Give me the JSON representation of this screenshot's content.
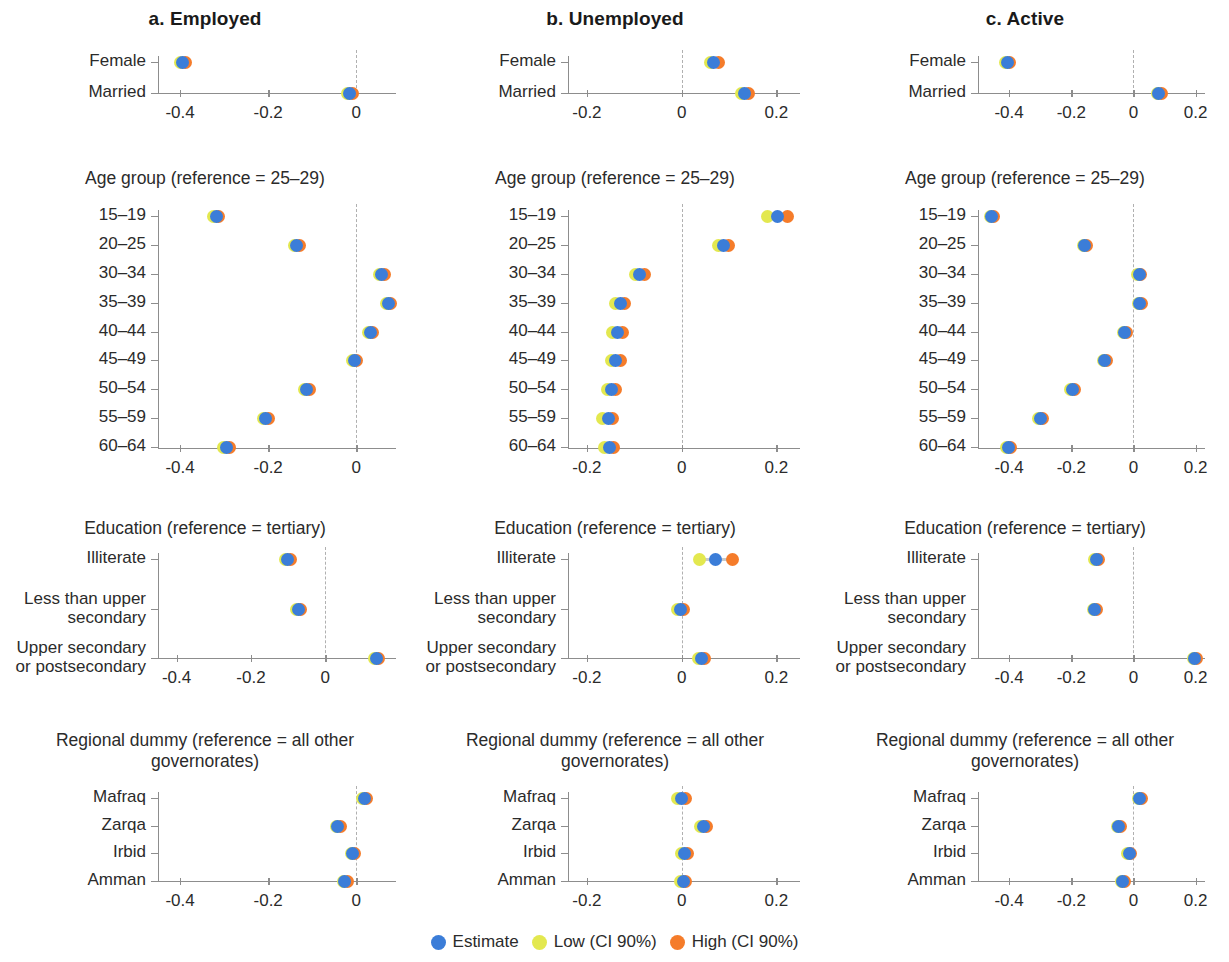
{
  "figure": {
    "column_titles": [
      "a. Employed",
      "b. Unemployed",
      "c. Active"
    ],
    "legend": [
      {
        "label": "Estimate",
        "color": "#3b7dd8",
        "key": "estimate"
      },
      {
        "label": "Low (CI 90%)",
        "color": "#e3e84f",
        "key": "low"
      },
      {
        "label": "High (CI 90%)",
        "color": "#f57c2a",
        "key": "high"
      }
    ],
    "block_titles": {
      "gender": "",
      "age": "Age group (reference = 25–29)",
      "education": "Education (reference = tertiary)",
      "region": "Regional dummy (reference =\nall other governorates)"
    }
  },
  "chart_data": {
    "type": "scatter",
    "series_names": [
      "Estimate",
      "Low (CI 90%)",
      "High (CI 90%)"
    ],
    "colors": {
      "estimate": "#3b7dd8",
      "low": "#e3e84f",
      "high": "#f57c2a"
    },
    "xlabel": "",
    "ylabel": "",
    "panels": [
      {
        "column": "a. Employed",
        "block": "gender",
        "block_title": "",
        "xlim": [
          -0.45,
          0.09
        ],
        "xticks": [
          -0.4,
          -0.2,
          0
        ],
        "xtick_labels": [
          "-0.4",
          "-0.2",
          "0"
        ],
        "categories": [
          "Female",
          "Married"
        ],
        "estimate": [
          -0.395,
          -0.015
        ],
        "low": [
          -0.4,
          -0.02
        ],
        "high": [
          -0.388,
          -0.008
        ]
      },
      {
        "column": "b. Unemployed",
        "block": "gender",
        "block_title": "",
        "xlim": [
          -0.24,
          0.25
        ],
        "xticks": [
          -0.2,
          0,
          0.2
        ],
        "xtick_labels": [
          "-0.2",
          "0",
          "0.2"
        ],
        "categories": [
          "Female",
          "Married"
        ],
        "estimate": [
          0.068,
          0.133
        ],
        "low": [
          0.062,
          0.126
        ],
        "high": [
          0.077,
          0.141
        ]
      },
      {
        "column": "c. Active",
        "block": "gender",
        "block_title": "",
        "xlim": [
          -0.5,
          0.23
        ],
        "xticks": [
          -0.4,
          -0.2,
          0,
          0.2
        ],
        "xtick_labels": [
          "-0.4",
          "-0.2",
          "0",
          "0.2"
        ],
        "categories": [
          "Female",
          "Married"
        ],
        "estimate": [
          -0.405,
          0.082
        ],
        "low": [
          -0.41,
          0.077
        ],
        "high": [
          -0.398,
          0.09
        ]
      },
      {
        "column": "a. Employed",
        "block": "age",
        "block_title": "Age group (reference = 25–29)",
        "xlim": [
          -0.45,
          0.09
        ],
        "xticks": [
          -0.4,
          -0.2,
          0
        ],
        "xtick_labels": [
          "-0.4",
          "-0.2",
          "0"
        ],
        "categories": [
          "15–19",
          "20–25",
          "30–34",
          "35–39",
          "40–44",
          "45–49",
          "50–54",
          "55–59",
          "60–64"
        ],
        "estimate": [
          -0.318,
          -0.135,
          0.058,
          0.072,
          0.032,
          -0.004,
          -0.113,
          -0.205,
          -0.295
        ],
        "low": [
          -0.323,
          -0.14,
          0.053,
          0.068,
          0.028,
          -0.009,
          -0.118,
          -0.211,
          -0.301
        ],
        "high": [
          -0.312,
          -0.129,
          0.064,
          0.078,
          0.037,
          0.001,
          -0.107,
          -0.199,
          -0.288
        ]
      },
      {
        "column": "b. Unemployed",
        "block": "age",
        "block_title": "Age group (reference = 25–29)",
        "xlim": [
          -0.24,
          0.25
        ],
        "xticks": [
          -0.2,
          0,
          0.2
        ],
        "xtick_labels": [
          "-0.2",
          "0",
          "0.2"
        ],
        "categories": [
          "15–19",
          "20–25",
          "30–34",
          "35–39",
          "40–44",
          "45–49",
          "50–54",
          "55–59",
          "60–64"
        ],
        "estimate": [
          0.202,
          0.088,
          -0.088,
          -0.13,
          -0.135,
          -0.14,
          -0.148,
          -0.155,
          -0.152
        ],
        "low": [
          0.182,
          0.078,
          -0.097,
          -0.14,
          -0.145,
          -0.149,
          -0.157,
          -0.167,
          -0.163
        ],
        "high": [
          0.223,
          0.1,
          -0.079,
          -0.12,
          -0.125,
          -0.13,
          -0.139,
          -0.145,
          -0.143
        ]
      },
      {
        "column": "c. Active",
        "block": "age",
        "block_title": "Age group (reference = 25–29)",
        "xlim": [
          -0.5,
          0.23
        ],
        "xticks": [
          -0.4,
          -0.2,
          0,
          0.2
        ],
        "xtick_labels": [
          "-0.4",
          "-0.2",
          "0",
          "0.2"
        ],
        "categories": [
          "15–19",
          "20–25",
          "30–34",
          "35–39",
          "40–44",
          "45–49",
          "50–54",
          "55–59",
          "60–64"
        ],
        "estimate": [
          -0.455,
          -0.157,
          0.018,
          0.02,
          -0.028,
          -0.092,
          -0.196,
          -0.3,
          -0.402
        ],
        "low": [
          -0.46,
          -0.162,
          0.013,
          0.015,
          -0.033,
          -0.098,
          -0.202,
          -0.307,
          -0.409
        ],
        "high": [
          -0.449,
          -0.151,
          0.024,
          0.026,
          -0.022,
          -0.086,
          -0.19,
          -0.293,
          -0.395
        ]
      },
      {
        "column": "a. Employed",
        "block": "education",
        "block_title": "Education (reference = tertiary)",
        "xlim": [
          -0.45,
          0.19
        ],
        "xticks": [
          -0.4,
          -0.2,
          0
        ],
        "xtick_labels": [
          "-0.4",
          "-0.2",
          "0"
        ],
        "categories": [
          "Illiterate",
          "Less than upper\nsecondary",
          "Upper secondary\nor postsecondary"
        ],
        "estimate": [
          -0.101,
          -0.073,
          0.137
        ],
        "low": [
          -0.107,
          -0.077,
          0.133
        ],
        "high": [
          -0.094,
          -0.068,
          0.142
        ]
      },
      {
        "column": "b. Unemployed",
        "block": "education",
        "block_title": "Education (reference = tertiary)",
        "xlim": [
          -0.24,
          0.25
        ],
        "xticks": [
          -0.2,
          0,
          0.2
        ],
        "xtick_labels": [
          "-0.2",
          "0",
          "0.2"
        ],
        "categories": [
          "Illiterate",
          "Less than upper\nsecondary",
          "Upper secondary\nor postsecondary"
        ],
        "estimate": [
          0.072,
          -0.003,
          0.042
        ],
        "low": [
          0.038,
          -0.009,
          0.036
        ],
        "high": [
          0.107,
          0.004,
          0.049
        ]
      },
      {
        "column": "c. Active",
        "block": "education",
        "block_title": "Education (reference = tertiary)",
        "xlim": [
          -0.5,
          0.23
        ],
        "xticks": [
          -0.4,
          -0.2,
          0,
          0.2
        ],
        "xtick_labels": [
          "-0.4",
          "-0.2",
          "0",
          "0.2"
        ],
        "categories": [
          "Illiterate",
          "Less than upper\nsecondary",
          "Upper secondary\nor postsecondary"
        ],
        "estimate": [
          -0.118,
          -0.125,
          0.197
        ],
        "low": [
          -0.124,
          -0.129,
          0.193
        ],
        "high": [
          -0.111,
          -0.12,
          0.202
        ]
      },
      {
        "column": "a. Employed",
        "block": "region",
        "block_title": "Regional dummy (reference =\nall other governorates)",
        "xlim": [
          -0.45,
          0.09
        ],
        "xticks": [
          -0.4,
          -0.2,
          0
        ],
        "xtick_labels": [
          "-0.4",
          "-0.2",
          "0"
        ],
        "categories": [
          "Mafraq",
          "Zarqa",
          "Irbid",
          "Amman"
        ],
        "estimate": [
          0.019,
          -0.042,
          -0.008,
          -0.026
        ],
        "low": [
          0.015,
          -0.046,
          -0.012,
          -0.03
        ],
        "high": [
          0.024,
          -0.037,
          -0.004,
          -0.021
        ]
      },
      {
        "column": "b. Unemployed",
        "block": "region",
        "block_title": "Regional dummy (reference =\nall other governorates)",
        "xlim": [
          -0.24,
          0.25
        ],
        "xticks": [
          -0.2,
          0,
          0.2
        ],
        "xtick_labels": [
          "-0.2",
          "0",
          "0.2"
        ],
        "categories": [
          "Mafraq",
          "Zarqa",
          "Irbid",
          "Amman"
        ],
        "estimate": [
          0.0,
          0.046,
          0.006,
          0.003
        ],
        "low": [
          -0.008,
          0.04,
          0.0,
          -0.002
        ],
        "high": [
          0.008,
          0.053,
          0.012,
          0.008
        ]
      },
      {
        "column": "c. Active",
        "block": "region",
        "block_title": "Regional dummy (reference =\nall other governorates)",
        "xlim": [
          -0.5,
          0.23
        ],
        "xticks": [
          -0.4,
          -0.2,
          0,
          0.2
        ],
        "xtick_labels": [
          "-0.4",
          "-0.2",
          "0",
          "0.2"
        ],
        "categories": [
          "Mafraq",
          "Zarqa",
          "Irbid",
          "Amman"
        ],
        "estimate": [
          0.02,
          -0.048,
          -0.014,
          -0.034
        ],
        "low": [
          0.016,
          -0.052,
          -0.018,
          -0.038
        ],
        "high": [
          0.026,
          -0.043,
          -0.009,
          -0.029
        ]
      }
    ]
  }
}
